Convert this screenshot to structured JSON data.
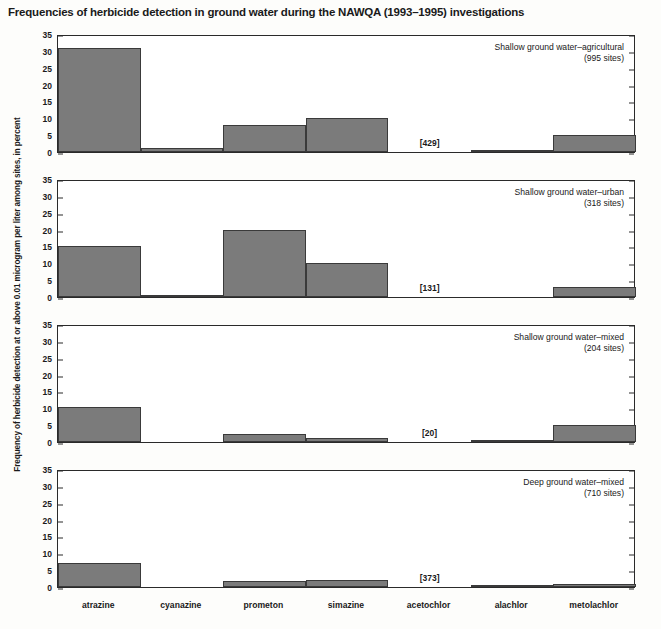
{
  "title": "Frequencies of herbicide detection in ground water during the NAWQA (1993–1995) investigations",
  "ylabel": "Frequency of herbicide detection at or above 0.01 microgram per liter among sites, in percent",
  "footnote": "",
  "axis": {
    "yticks": [
      "0",
      "5",
      "10",
      "15",
      "20",
      "25",
      "30",
      "35"
    ],
    "ymin": 0,
    "ymax": 35
  },
  "colors": {
    "bar_fill": "#7b7b7b",
    "bar_stroke": "#3a3a3a",
    "axis": "#2a2a2a",
    "background": "#fdfdfb",
    "plot_background": "#ffffff"
  },
  "categories": [
    "atrazine",
    "cyanazine",
    "prometon",
    "simazine",
    "acetochlor",
    "alachlor",
    "metolachlor"
  ],
  "chart_data": {
    "type": "bar",
    "title": "Frequencies of herbicide detection in ground water during the NAWQA (1993–1995) investigations",
    "xlabel": "",
    "ylabel": "Frequency of herbicide detection at or above 0.01 microgram per liter among sites, in percent",
    "ylim": [
      0,
      35
    ],
    "yticks": [
      0,
      5,
      10,
      15,
      20,
      25,
      30,
      35
    ],
    "grid": false,
    "legend": "none",
    "categories": [
      "atrazine",
      "cyanazine",
      "prometon",
      "simazine",
      "acetochlor",
      "alachlor",
      "metolachlor"
    ],
    "panels": [
      {
        "name": "shallow-ground-water-agricultural",
        "caption_line1": "Shallow ground water–agricultural",
        "caption_line2": "(995 sites)",
        "sites": 995,
        "values": [
          31,
          1.2,
          8,
          10,
          0,
          0.5,
          5
        ],
        "annotations": [
          {
            "category": "acetochlor",
            "text": "[429]"
          }
        ]
      },
      {
        "name": "shallow-ground-water-urban",
        "caption_line1": "Shallow ground water–urban",
        "caption_line2": "(318 sites)",
        "sites": 318,
        "values": [
          15,
          0.7,
          20,
          10,
          0,
          0,
          3
        ],
        "annotations": [
          {
            "category": "acetochlor",
            "text": "[131]"
          }
        ]
      },
      {
        "name": "shallow-ground-water-mixed",
        "caption_line1": "Shallow ground water–mixed",
        "caption_line2": "(204 sites)",
        "sites": 204,
        "values": [
          10.3,
          0,
          2.5,
          1.3,
          0,
          0.3,
          5
        ],
        "annotations": [
          {
            "category": "acetochlor",
            "text": "[20]"
          }
        ]
      },
      {
        "name": "deep-ground-water-mixed",
        "caption_line1": "Deep ground water–mixed",
        "caption_line2": "(710 sites)",
        "sites": 710,
        "values": [
          7,
          0,
          1.7,
          2,
          0,
          0.2,
          1
        ],
        "annotations": [
          {
            "category": "acetochlor",
            "text": "[373]"
          }
        ]
      }
    ]
  },
  "panel_geometry": [
    {
      "top": 35,
      "height": 118
    },
    {
      "top": 180,
      "height": 118
    },
    {
      "top": 325,
      "height": 118
    },
    {
      "top": 470,
      "height": 118
    }
  ]
}
